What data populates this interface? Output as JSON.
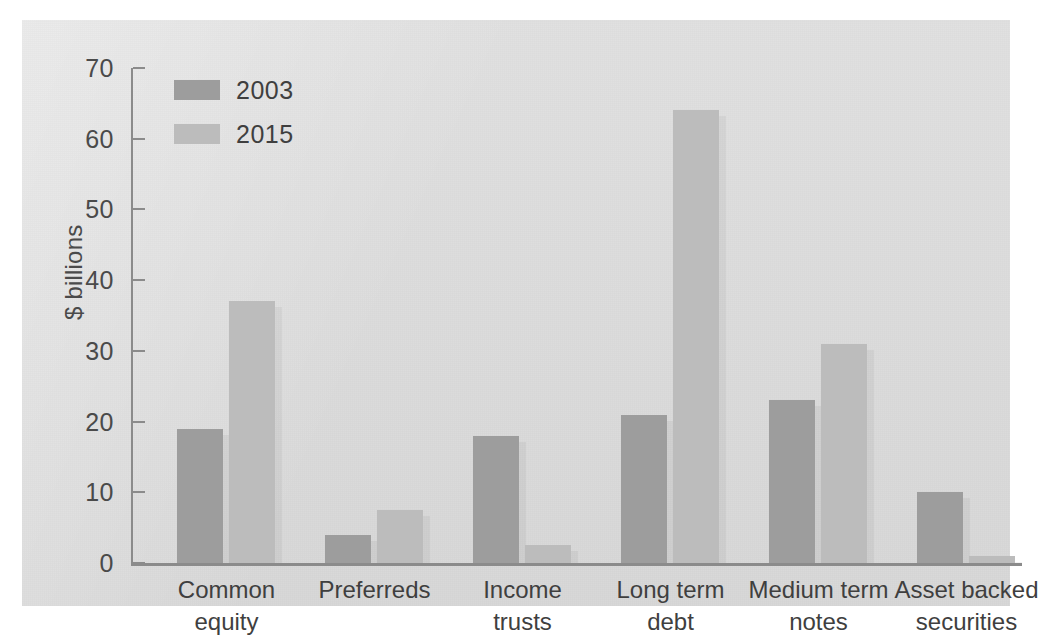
{
  "chart_data": {
    "type": "bar",
    "title": "",
    "xlabel": "",
    "ylabel": "$ billions",
    "ylim": [
      0,
      70
    ],
    "yticks": [
      0,
      10,
      20,
      30,
      40,
      50,
      60,
      70
    ],
    "grid": false,
    "legend_position": "top-left",
    "categories": [
      "Common\nequity",
      "Preferreds",
      "Income\ntrusts",
      "Long term\ndebt",
      "Medium term\nnotes",
      "Asset backed\nsecurities"
    ],
    "series": [
      {
        "name": "2003",
        "color": "#9d9d9d",
        "values": [
          19.0,
          4.0,
          18.0,
          21.0,
          23.0,
          10.0
        ]
      },
      {
        "name": "2015",
        "color": "#bcbcbc",
        "values": [
          37.0,
          7.5,
          2.5,
          64.0,
          31.0,
          1.0
        ]
      }
    ]
  },
  "legend": {
    "items": [
      {
        "label": "2003",
        "color": "#9d9d9d"
      },
      {
        "label": "2015",
        "color": "#bcbcbc"
      }
    ]
  },
  "axis": {
    "y_title": "$ billions",
    "y_tick_labels": [
      "70",
      "60",
      "50",
      "40",
      "30",
      "20",
      "10",
      "0"
    ]
  },
  "colors": {
    "panel_background": "#dddddd",
    "page_background": "#ffffff",
    "axis": "#8b8b8b",
    "text": "#3f3f3f",
    "series_2003": "#9d9d9d",
    "series_2015": "#bcbcbc"
  }
}
